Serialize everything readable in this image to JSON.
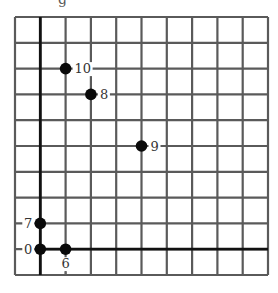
{
  "caption_fragment": "g",
  "grid": {
    "cols": 10,
    "rows": 10,
    "left": 15,
    "top": 17,
    "cell_w": 25.3,
    "cell_h": 25.8,
    "line_color": "#5a5a5a",
    "axis_color": "#111111"
  },
  "axes": {
    "y_axis_col": 1,
    "x_axis_row": 9
  },
  "points": [
    {
      "label": "10",
      "col": 2,
      "row": 2,
      "label_side": "right"
    },
    {
      "label": "8",
      "col": 3,
      "row": 3,
      "label_side": "right"
    },
    {
      "label": "9",
      "col": 5,
      "row": 5,
      "label_side": "right"
    },
    {
      "label": "7",
      "col": 1,
      "row": 8,
      "label_side": "left"
    },
    {
      "label": "0",
      "col": 1,
      "row": 9,
      "label_side": "left"
    },
    {
      "label": "6",
      "col": 2,
      "row": 9,
      "label_side": "below"
    }
  ],
  "colors": {
    "point": "#0a0a0a",
    "label": "#333333"
  }
}
